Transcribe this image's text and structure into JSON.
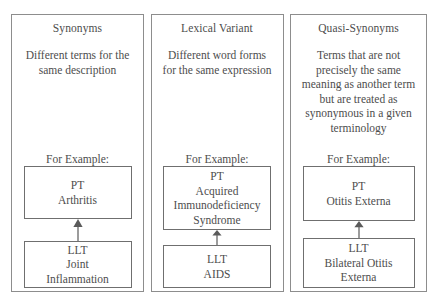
{
  "diagram": {
    "title_semantic": "synonym-types-comparison",
    "colors": {
      "panel_border": "#8d8d8d",
      "box_border": "#6f6f6f",
      "text": "#4d4d4d",
      "background": "#ffffff",
      "arrow": "#5a5a5a"
    }
  },
  "panels": [
    {
      "id": "synonyms",
      "title": "Synonyms",
      "description": "Different terms for the same description",
      "for_example_label": "For Example:",
      "pt_box": {
        "type_label": "PT",
        "term_lines": [
          "Arthritis"
        ]
      },
      "llt_box": {
        "type_label": "LLT",
        "term_lines": [
          "Joint",
          "Inflammation"
        ]
      },
      "arrow": "up-arrow-icon"
    },
    {
      "id": "lexical-variant",
      "title": "Lexical Variant",
      "description": "Different word forms for the same expression",
      "for_example_label": "For Example:",
      "pt_box": {
        "type_label": "PT",
        "term_lines": [
          "Acquired",
          "Immunodeficiency",
          "Syndrome"
        ]
      },
      "llt_box": {
        "type_label": "LLT",
        "term_lines": [
          "AIDS"
        ]
      },
      "arrow": "up-arrow-icon"
    },
    {
      "id": "quasi-synonyms",
      "title": "Quasi-Synonyms",
      "description": "Terms that are not precisely the same meaning as another term but are treated as synonymous in a given terminology",
      "for_example_label": "For Example:",
      "pt_box": {
        "type_label": "PT",
        "term_lines": [
          "Otitis Externa"
        ]
      },
      "llt_box": {
        "type_label": "LLT",
        "term_lines": [
          "Bilateral Otitis",
          "Externa"
        ]
      },
      "arrow": "up-arrow-icon"
    }
  ]
}
